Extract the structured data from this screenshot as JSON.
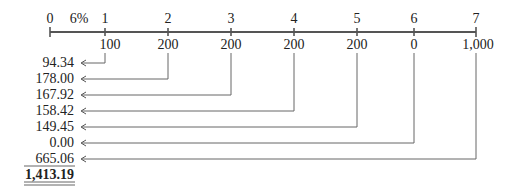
{
  "timeline": {
    "periods": [
      "0",
      "1",
      "2",
      "3",
      "4",
      "5",
      "6",
      "7"
    ],
    "rate_label": "6%",
    "cash_flows": [
      "100",
      "200",
      "200",
      "200",
      "200",
      "0",
      "1,000"
    ]
  },
  "present_values": [
    "94.34",
    "178.00",
    "167.92",
    "158.42",
    "149.45",
    "0.00",
    "665.06"
  ],
  "total": "1,413.19",
  "colors": {
    "line": "#555555",
    "text": "#222222"
  }
}
